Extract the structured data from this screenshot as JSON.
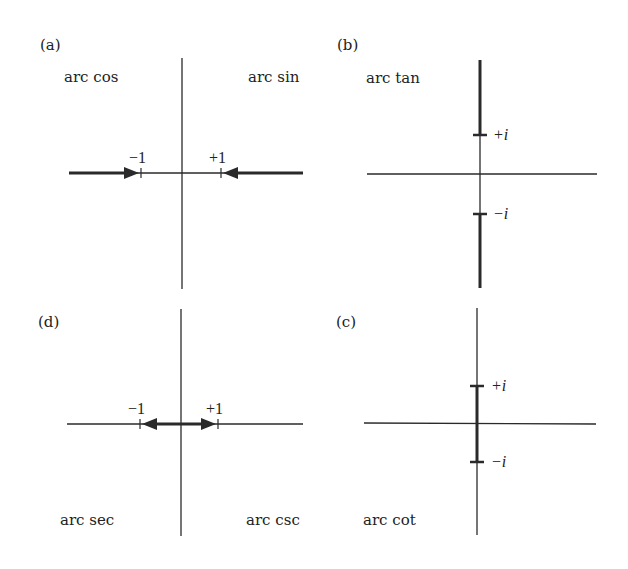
{
  "figure": {
    "panels": [
      {
        "id": "a",
        "label": "(a)",
        "functions": [
          "arc cos",
          "arc sin"
        ],
        "tick_labels": [
          "−1",
          "+1"
        ],
        "branch_cuts": "real axis from -∞ to -1 and from +1 to +∞ (arrows pointing toward ±1)"
      },
      {
        "id": "b",
        "label": "(b)",
        "functions": [
          "arc tan"
        ],
        "tick_labels": [
          "+i",
          "−i"
        ],
        "branch_cuts": "imaginary axis from +i to +i∞ and from -i to -i∞"
      },
      {
        "id": "d",
        "label": "(d)",
        "functions": [
          "arc sec",
          "arc csc"
        ],
        "tick_labels": [
          "−1",
          "+1"
        ],
        "branch_cuts": "real axis segment between -1 and +1 (double arrow)"
      },
      {
        "id": "c",
        "label": "(c)",
        "functions": [
          "arc cot"
        ],
        "tick_labels": [
          "+i",
          "−i"
        ],
        "branch_cuts": "imaginary axis segment between -i and +i"
      }
    ]
  },
  "panel_a": {
    "label": "(a)",
    "left_fn": "arc cos",
    "right_fn": "arc sin",
    "neg_tick": "−1",
    "pos_tick": "+1"
  },
  "panel_b": {
    "label": "(b)",
    "fn": "arc tan",
    "pos_tick": "+i",
    "neg_tick": "−i"
  },
  "panel_d": {
    "label": "(d)",
    "left_fn": "arc sec",
    "right_fn": "arc csc",
    "neg_tick": "−1",
    "pos_tick": "+1"
  },
  "panel_c": {
    "label": "(c)",
    "fn": "arc cot",
    "pos_tick": "+i",
    "neg_tick": "−i"
  }
}
